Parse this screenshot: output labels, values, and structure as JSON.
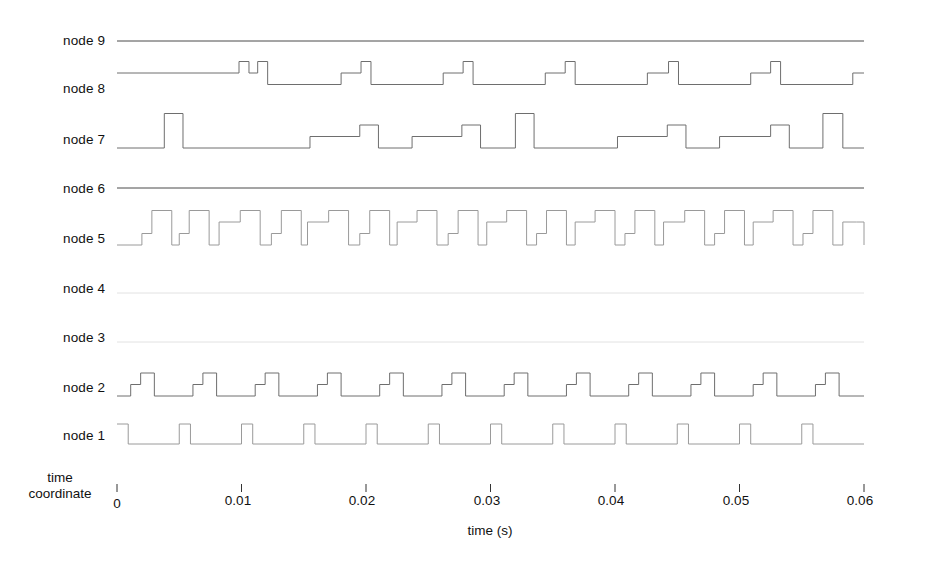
{
  "figure": {
    "title": "",
    "background_color": "#ffffff",
    "width": 925,
    "height": 576
  },
  "axis": {
    "x_title": "time (s)",
    "tick_labels": [
      "0",
      "0.01",
      "0.02",
      "0.03",
      "0.04",
      "0.05",
      "0.06"
    ],
    "tick_values": [
      0,
      0.01,
      0.02,
      0.03,
      0.04,
      0.05,
      0.06
    ],
    "corner_label_line1": "time",
    "corner_label_line2": "coordinate"
  },
  "rows": [
    {
      "label": "node 9"
    },
    {
      "label": "node 8"
    },
    {
      "label": "node 7"
    },
    {
      "label": "node 6"
    },
    {
      "label": "node 5"
    },
    {
      "label": "node 4"
    },
    {
      "label": "node 3"
    },
    {
      "label": "node 2"
    },
    {
      "label": "node 1"
    }
  ],
  "chart_data": {
    "type": "line",
    "title": "",
    "xlabel": "time (s)",
    "ylabel": "",
    "xlim": [
      0,
      0.06
    ],
    "grid": false,
    "legend_position": "left-labels",
    "x_ticks": [
      0,
      0.01,
      0.02,
      0.03,
      0.04,
      0.05,
      0.06
    ],
    "x_tick_labels": [
      "0",
      "0.01",
      "0.02",
      "0.03",
      "0.04",
      "0.05",
      "0.06"
    ],
    "series": [
      {
        "name": "node 9",
        "row": 0,
        "style": "flat",
        "levels": [
          0
        ],
        "period": 0,
        "note": "constant flat line across the full time span",
        "steps": [
          [
            0.0,
            0
          ]
        ]
      },
      {
        "name": "node 8",
        "row": 1,
        "style": "staircase",
        "levels": [
          0,
          1,
          2,
          3
        ],
        "period": 0.01,
        "note": "long-period multi-level staircase; baseline mid-level with short high pulses",
        "steps": [
          [
            0.0,
            2
          ],
          [
            0.0098,
            3
          ],
          [
            0.0106,
            2
          ],
          [
            0.0113,
            3
          ],
          [
            0.0121,
            1
          ],
          [
            0.018,
            2
          ],
          [
            0.0196,
            3
          ],
          [
            0.0204,
            1
          ],
          [
            0.0262,
            2
          ],
          [
            0.0278,
            3
          ],
          [
            0.0286,
            1
          ],
          [
            0.0344,
            2
          ],
          [
            0.036,
            3
          ],
          [
            0.0368,
            1
          ],
          [
            0.0426,
            2
          ],
          [
            0.0443,
            3
          ],
          [
            0.0451,
            1
          ],
          [
            0.0509,
            2
          ],
          [
            0.0525,
            3
          ],
          [
            0.0533,
            1
          ],
          [
            0.0591,
            2
          ],
          [
            0.06,
            2
          ]
        ]
      },
      {
        "name": "node 7",
        "row": 2,
        "style": "staircase",
        "levels": [
          0,
          1,
          2,
          3
        ],
        "period": 0.008,
        "note": "baseline low with periodic tall narrow pulses and intermediate plateaus",
        "steps": [
          [
            0.0,
            0
          ],
          [
            0.0038,
            3
          ],
          [
            0.0053,
            0
          ],
          [
            0.0155,
            1
          ],
          [
            0.0195,
            2
          ],
          [
            0.021,
            0
          ],
          [
            0.0237,
            1
          ],
          [
            0.0277,
            2
          ],
          [
            0.0292,
            0
          ],
          [
            0.032,
            3
          ],
          [
            0.0335,
            0
          ],
          [
            0.0402,
            1
          ],
          [
            0.0442,
            2
          ],
          [
            0.0457,
            0
          ],
          [
            0.0484,
            1
          ],
          [
            0.0525,
            2
          ],
          [
            0.054,
            0
          ],
          [
            0.0567,
            3
          ],
          [
            0.0583,
            0
          ],
          [
            0.06,
            0
          ]
        ]
      },
      {
        "name": "node 6",
        "row": 3,
        "style": "flat",
        "levels": [
          0
        ],
        "period": 0,
        "note": "constant flat line across the full time span",
        "steps": [
          [
            0.0,
            0
          ]
        ]
      },
      {
        "name": "node 5",
        "row": 4,
        "style": "staircase",
        "levels": [
          0,
          1,
          2,
          3
        ],
        "period": 0.005,
        "note": "fast multi-level staircase, roughly two bursts per 0.005 s period",
        "steps": [
          [
            0.0,
            0
          ],
          [
            0.002,
            1
          ],
          [
            0.0028,
            3
          ],
          [
            0.0044,
            0
          ],
          [
            0.005,
            1
          ],
          [
            0.0058,
            3
          ],
          [
            0.0074,
            0
          ],
          [
            0.0082,
            2
          ],
          [
            0.0099,
            3
          ],
          [
            0.0115,
            0
          ],
          [
            0.0124,
            1
          ],
          [
            0.0132,
            3
          ],
          [
            0.0148,
            0
          ],
          [
            0.0153,
            2
          ],
          [
            0.017,
            3
          ],
          [
            0.0186,
            0
          ],
          [
            0.0195,
            1
          ],
          [
            0.0203,
            3
          ],
          [
            0.0219,
            0
          ],
          [
            0.0225,
            2
          ],
          [
            0.0241,
            3
          ],
          [
            0.0257,
            0
          ],
          [
            0.0266,
            1
          ],
          [
            0.0274,
            3
          ],
          [
            0.029,
            0
          ],
          [
            0.0297,
            2
          ],
          [
            0.0313,
            3
          ],
          [
            0.0329,
            0
          ],
          [
            0.0337,
            1
          ],
          [
            0.0345,
            3
          ],
          [
            0.0361,
            0
          ],
          [
            0.0368,
            2
          ],
          [
            0.0384,
            3
          ],
          [
            0.04,
            0
          ],
          [
            0.0408,
            1
          ],
          [
            0.0416,
            3
          ],
          [
            0.0432,
            0
          ],
          [
            0.0439,
            2
          ],
          [
            0.0456,
            3
          ],
          [
            0.0472,
            0
          ],
          [
            0.048,
            1
          ],
          [
            0.0488,
            3
          ],
          [
            0.0504,
            0
          ],
          [
            0.0511,
            2
          ],
          [
            0.0527,
            3
          ],
          [
            0.0543,
            0
          ],
          [
            0.0551,
            1
          ],
          [
            0.0559,
            3
          ],
          [
            0.0575,
            0
          ],
          [
            0.0583,
            2
          ],
          [
            0.0594,
            2
          ],
          [
            0.06,
            0
          ]
        ]
      },
      {
        "name": "node 4",
        "row": 5,
        "style": "flat-faint",
        "levels": [
          0
        ],
        "period": 0,
        "note": "very faint / near-blank trace at baseline",
        "steps": [
          [
            0.0,
            0
          ]
        ]
      },
      {
        "name": "node 3",
        "row": 6,
        "style": "flat-faint",
        "levels": [
          0
        ],
        "period": 0,
        "note": "very faint / near-blank trace at baseline",
        "steps": [
          [
            0.0,
            0
          ]
        ]
      },
      {
        "name": "node 2",
        "row": 7,
        "style": "staircase",
        "levels": [
          0,
          1,
          2
        ],
        "period": 0.005,
        "note": "repeating two-step staircase: baseline, mid step, high step, return to baseline",
        "steps": [
          [
            0.0,
            0
          ],
          [
            0.0011,
            1
          ],
          [
            0.0019,
            2
          ],
          [
            0.003,
            0
          ],
          [
            0.0061,
            1
          ],
          [
            0.0069,
            2
          ],
          [
            0.008,
            0
          ],
          [
            0.0111,
            1
          ],
          [
            0.0119,
            2
          ],
          [
            0.013,
            0
          ],
          [
            0.0161,
            1
          ],
          [
            0.0169,
            2
          ],
          [
            0.018,
            0
          ],
          [
            0.0211,
            1
          ],
          [
            0.0219,
            2
          ],
          [
            0.023,
            0
          ],
          [
            0.0261,
            1
          ],
          [
            0.0269,
            2
          ],
          [
            0.028,
            0
          ],
          [
            0.0311,
            1
          ],
          [
            0.0319,
            2
          ],
          [
            0.033,
            0
          ],
          [
            0.0361,
            1
          ],
          [
            0.0369,
            2
          ],
          [
            0.038,
            0
          ],
          [
            0.0411,
            1
          ],
          [
            0.0419,
            2
          ],
          [
            0.043,
            0
          ],
          [
            0.0461,
            1
          ],
          [
            0.0469,
            2
          ],
          [
            0.048,
            0
          ],
          [
            0.0511,
            1
          ],
          [
            0.0519,
            2
          ],
          [
            0.053,
            0
          ],
          [
            0.0561,
            1
          ],
          [
            0.0569,
            2
          ],
          [
            0.058,
            0
          ],
          [
            0.06,
            0
          ]
        ]
      },
      {
        "name": "node 1",
        "row": 8,
        "style": "pulse",
        "levels": [
          0,
          1
        ],
        "period": 0.005,
        "duty": 0.18,
        "note": "simple periodic rectangular pulse train, 12 pulses over 0.06 s",
        "steps": [
          [
            0.0,
            1
          ],
          [
            0.0009,
            0
          ],
          [
            0.005,
            1
          ],
          [
            0.0059,
            0
          ],
          [
            0.01,
            1
          ],
          [
            0.0109,
            0
          ],
          [
            0.015,
            1
          ],
          [
            0.0159,
            0
          ],
          [
            0.02,
            1
          ],
          [
            0.0209,
            0
          ],
          [
            0.025,
            1
          ],
          [
            0.0259,
            0
          ],
          [
            0.03,
            1
          ],
          [
            0.0309,
            0
          ],
          [
            0.035,
            1
          ],
          [
            0.0359,
            0
          ],
          [
            0.04,
            1
          ],
          [
            0.0409,
            0
          ],
          [
            0.045,
            1
          ],
          [
            0.0459,
            0
          ],
          [
            0.05,
            1
          ],
          [
            0.0509,
            0
          ],
          [
            0.055,
            1
          ],
          [
            0.0559,
            0
          ],
          [
            0.06,
            0
          ]
        ]
      }
    ]
  },
  "colors": {
    "background": "#ffffff",
    "trace": "#6e6e6e",
    "trace_strong": "#4a4a4a",
    "trace_faint": "#e2e2e2",
    "text": "#111111",
    "tick": "#333333"
  }
}
